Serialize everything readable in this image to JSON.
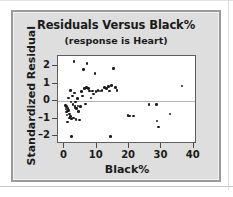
{
  "figure": {
    "panel_bg": "#dedede",
    "panel_border": "#9a9a9a",
    "plot_bg": "#ffffff",
    "point_color": "#1c1c1c",
    "zero_line_color": "#b4b4b4"
  },
  "chart_data": {
    "type": "scatter",
    "title": "Residuals Versus Black%",
    "subtitle": "(response is Heart)",
    "xlabel": "Black%",
    "ylabel": "Standardized Residual",
    "xlim": [
      -2,
      41
    ],
    "ylim": [
      -2.45,
      2.6
    ],
    "xticks": [
      0,
      10,
      20,
      30,
      40
    ],
    "xticklabels": [
      "0",
      "10",
      "20",
      "30",
      "40"
    ],
    "yticks": [
      2,
      1,
      0,
      -1,
      -2
    ],
    "yticklabels": [
      "2",
      "1",
      "0",
      "–1",
      "–2"
    ],
    "grid": false,
    "legend": "none",
    "reference_lines": [
      {
        "axis": "y",
        "value": 0,
        "color": "#b4b4b4"
      }
    ],
    "points": [
      [
        0.4,
        -0.25
      ],
      [
        0.5,
        -0.45
      ],
      [
        0.6,
        -0.62
      ],
      [
        0.7,
        -0.3
      ],
      [
        0.8,
        -0.78
      ],
      [
        0.9,
        -1.18
      ],
      [
        1.0,
        -0.55
      ],
      [
        1.1,
        -0.4
      ],
      [
        1.2,
        0.18
      ],
      [
        1.3,
        -0.52
      ],
      [
        1.5,
        -0.72
      ],
      [
        1.6,
        -0.95
      ],
      [
        1.8,
        0.62
      ],
      [
        1.9,
        -0.88
      ],
      [
        2.0,
        -0.05
      ],
      [
        2.1,
        -1.02
      ],
      [
        2.2,
        -2.02
      ],
      [
        2.4,
        0.3
      ],
      [
        2.6,
        -0.2
      ],
      [
        2.8,
        -0.95
      ],
      [
        3.0,
        2.28
      ],
      [
        3.1,
        0.48
      ],
      [
        3.2,
        -0.35
      ],
      [
        3.3,
        -0.3
      ],
      [
        3.5,
        -0.05
      ],
      [
        3.6,
        -1.05
      ],
      [
        3.8,
        -0.42
      ],
      [
        4.0,
        0.15
      ],
      [
        4.2,
        -0.28
      ],
      [
        4.4,
        -0.6
      ],
      [
        4.6,
        -1.08
      ],
      [
        5.0,
        -0.3
      ],
      [
        5.3,
        0.55
      ],
      [
        5.6,
        0.3
      ],
      [
        5.9,
        1.82
      ],
      [
        6.2,
        0.72
      ],
      [
        6.5,
        -0.15
      ],
      [
        6.8,
        0.8
      ],
      [
        7.0,
        2.18
      ],
      [
        7.4,
        0.72
      ],
      [
        7.8,
        0.58
      ],
      [
        8.2,
        0.2
      ],
      [
        8.6,
        0.6
      ],
      [
        9.0,
        0.42
      ],
      [
        9.4,
        1.58
      ],
      [
        9.8,
        0.55
      ],
      [
        10.4,
        0.62
      ],
      [
        11.0,
        0.6
      ],
      [
        11.6,
        0.62
      ],
      [
        12.4,
        0.8
      ],
      [
        13.0,
        0.72
      ],
      [
        13.6,
        0.85
      ],
      [
        14.0,
        0.58
      ],
      [
        14.3,
        -2.02
      ],
      [
        14.6,
        0.92
      ],
      [
        15.2,
        1.88
      ],
      [
        15.8,
        0.8
      ],
      [
        16.2,
        0.62
      ],
      [
        19.6,
        -0.82
      ],
      [
        20.2,
        -0.85
      ],
      [
        21.4,
        -0.85
      ],
      [
        26.2,
        -0.18
      ],
      [
        28.4,
        -0.18
      ],
      [
        28.6,
        -1.12
      ],
      [
        29.0,
        -1.48
      ],
      [
        32.6,
        -0.72
      ],
      [
        36.4,
        0.88
      ]
    ]
  }
}
